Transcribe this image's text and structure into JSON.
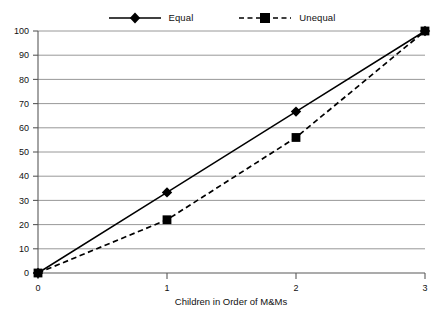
{
  "chart_data": {
    "type": "line",
    "title": "",
    "xlabel": "Children in Order of M&Ms",
    "ylabel": "",
    "x": [
      0,
      1,
      2,
      3
    ],
    "xticklabels": [
      "0",
      "1",
      "2",
      "3"
    ],
    "xlim": [
      0,
      3
    ],
    "ylim": [
      0,
      100
    ],
    "yticks": [
      0,
      10,
      20,
      30,
      40,
      50,
      60,
      70,
      80,
      90,
      100
    ],
    "yticklabels": [
      "0",
      "10",
      "20",
      "30",
      "40",
      "50",
      "60",
      "70",
      "80",
      "90",
      "100"
    ],
    "grid": "horizontal",
    "legend_position": "top-center",
    "series": [
      {
        "name": "Equal",
        "values": [
          0,
          33.3,
          66.7,
          100
        ],
        "line_style": "solid",
        "marker": "diamond",
        "color": "#000000"
      },
      {
        "name": "Unequal",
        "values": [
          0,
          22,
          56,
          100
        ],
        "line_style": "dashed",
        "marker": "square",
        "color": "#000000"
      }
    ]
  },
  "legend": {
    "items": [
      {
        "label": "Equal",
        "marker": "diamond-marker",
        "style": "solid"
      },
      {
        "label": "Unequal",
        "marker": "square-marker",
        "style": "dashed"
      }
    ]
  },
  "axes": {
    "x_title": "Children in Order of M&Ms",
    "x_labels": [
      "0",
      "1",
      "2",
      "3"
    ],
    "y_labels": [
      "100",
      "90",
      "80",
      "70",
      "60",
      "50",
      "40",
      "30",
      "20",
      "10",
      "0"
    ]
  },
  "colors": {
    "series": "#000000",
    "grid": "#8c8c8c",
    "axis": "#595959",
    "background": "#ffffff"
  }
}
